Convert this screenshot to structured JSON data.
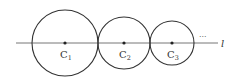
{
  "diagram": {
    "line": {
      "label": "l",
      "y": 43,
      "x_start": 16,
      "x_end": 218,
      "color": "#555555"
    },
    "ellipsis": "···",
    "circles": [
      {
        "name": "C",
        "subscript": "1",
        "cx": 65,
        "cy": 43,
        "r": 33
      },
      {
        "name": "C",
        "subscript": "2",
        "cx": 124,
        "cy": 43,
        "r": 26
      },
      {
        "name": "C",
        "subscript": "3",
        "cx": 172,
        "cy": 43,
        "r": 22
      }
    ],
    "stroke_color": "#333333"
  }
}
